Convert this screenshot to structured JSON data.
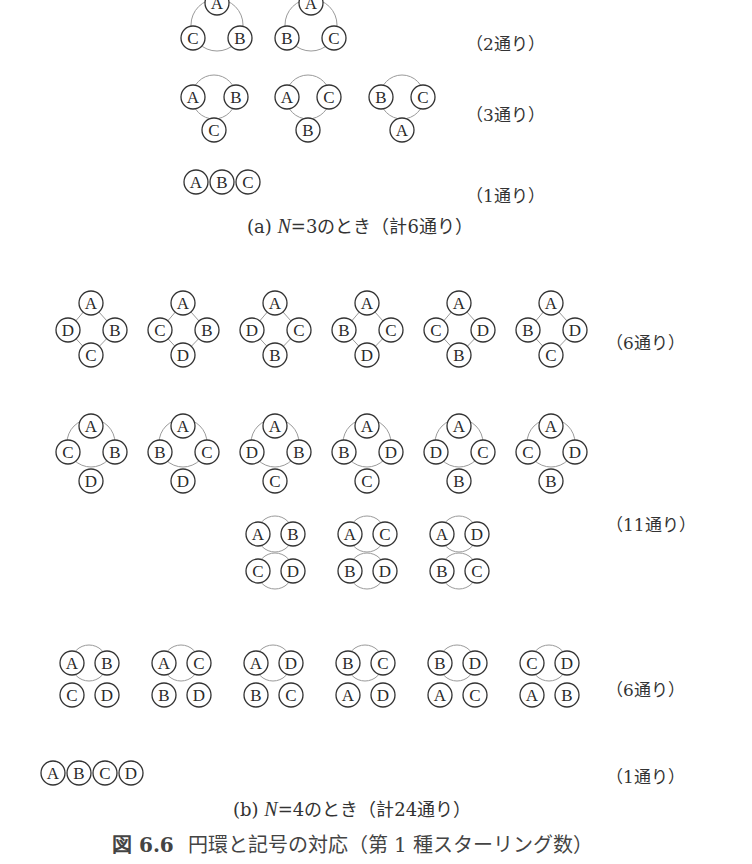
{
  "colors": {
    "node_stroke": "#333333",
    "ring_stroke": "#9a9a9a",
    "text": "#333333",
    "background": "#ffffff"
  },
  "node_radius": 12,
  "section_a": {
    "caption_prefix": "(a)",
    "caption_var": "N",
    "caption_rest": "=3のとき（計6通り）",
    "groups": [
      {
        "count_label": "（2通り）",
        "label_pos": [
          466,
          42
        ],
        "diagrams": [
          {
            "ring": [
              217,
              25,
              26
            ],
            "nodes": [
              [
                "A",
                217,
                3
              ],
              [
                "C",
                193,
                38
              ],
              [
                "B",
                240,
                38
              ]
            ]
          },
          {
            "ring": [
              311,
              25,
              26
            ],
            "nodes": [
              [
                "A",
                311,
                3
              ],
              [
                "B",
                287,
                38
              ],
              [
                "C",
                334,
                38
              ]
            ]
          }
        ]
      },
      {
        "count_label": "（3通り）",
        "label_pos": [
          466,
          113
        ],
        "diagrams": [
          {
            "ring": [
              214,
              97,
              22
            ],
            "nodes": [
              [
                "A",
                193,
                97
              ],
              [
                "B",
                236,
                97
              ],
              [
                "C",
                214,
                130
              ]
            ]
          },
          {
            "ring": [
              308,
              97,
              22
            ],
            "nodes": [
              [
                "A",
                287,
                97
              ],
              [
                "C",
                329,
                97
              ],
              [
                "B",
                308,
                130
              ]
            ]
          },
          {
            "ring": [
              402,
              97,
              22
            ],
            "nodes": [
              [
                "B",
                381,
                97
              ],
              [
                "C",
                423,
                97
              ],
              [
                "A",
                402,
                130
              ]
            ]
          }
        ]
      },
      {
        "count_label": "（1通り）",
        "label_pos": [
          466,
          194
        ],
        "diagrams": [
          {
            "ring": null,
            "nodes": [
              [
                "A",
                196,
                182
              ],
              [
                "B",
                222,
                182
              ],
              [
                "C",
                248,
                182
              ]
            ]
          }
        ]
      }
    ]
  },
  "section_b": {
    "caption_prefix": "(b)",
    "caption_var": "N",
    "caption_rest": "=4のとき（計24通り）",
    "groups": [
      {
        "count_label": "（6通り）",
        "label_pos": [
          606,
          341
        ],
        "diagrams": [
          {
            "diamond": true,
            "nodes": [
              [
                "A",
                91,
                303
              ],
              [
                "D",
                68,
                330
              ],
              [
                "B",
                115,
                330
              ],
              [
                "C",
                91,
                355
              ]
            ]
          },
          {
            "diamond": true,
            "nodes": [
              [
                "A",
                183,
                303
              ],
              [
                "C",
                160,
                330
              ],
              [
                "B",
                207,
                330
              ],
              [
                "D",
                183,
                355
              ]
            ]
          },
          {
            "diamond": true,
            "nodes": [
              [
                "A",
                275,
                303
              ],
              [
                "D",
                252,
                330
              ],
              [
                "C",
                299,
                330
              ],
              [
                "B",
                275,
                355
              ]
            ]
          },
          {
            "diamond": true,
            "nodes": [
              [
                "A",
                367,
                303
              ],
              [
                "B",
                344,
                330
              ],
              [
                "C",
                391,
                330
              ],
              [
                "D",
                367,
                355
              ]
            ]
          },
          {
            "diamond": true,
            "nodes": [
              [
                "A",
                459,
                303
              ],
              [
                "C",
                436,
                330
              ],
              [
                "D",
                483,
                330
              ],
              [
                "B",
                459,
                355
              ]
            ]
          },
          {
            "diamond": true,
            "nodes": [
              [
                "A",
                551,
                303
              ],
              [
                "B",
                528,
                330
              ],
              [
                "D",
                575,
                330
              ],
              [
                "C",
                551,
                355
              ]
            ]
          }
        ]
      },
      {
        "count_label": "（11通り）",
        "label_pos": [
          606,
          523
        ],
        "diagrams": [
          {
            "ring": [
              91,
              443,
              24
            ],
            "nodes": [
              [
                "A",
                91,
                426
              ],
              [
                "C",
                68,
                452
              ],
              [
                "B",
                115,
                452
              ],
              [
                "D",
                91,
                481
              ]
            ]
          },
          {
            "ring": [
              183,
              443,
              24
            ],
            "nodes": [
              [
                "A",
                183,
                426
              ],
              [
                "B",
                160,
                452
              ],
              [
                "C",
                207,
                452
              ],
              [
                "D",
                183,
                481
              ]
            ]
          },
          {
            "ring": [
              275,
              443,
              24
            ],
            "nodes": [
              [
                "A",
                275,
                426
              ],
              [
                "D",
                252,
                452
              ],
              [
                "B",
                299,
                452
              ],
              [
                "C",
                275,
                481
              ]
            ]
          },
          {
            "ring": [
              367,
              443,
              24
            ],
            "nodes": [
              [
                "A",
                367,
                426
              ],
              [
                "B",
                344,
                452
              ],
              [
                "D",
                391,
                452
              ],
              [
                "C",
                367,
                481
              ]
            ]
          },
          {
            "ring": [
              459,
              443,
              24
            ],
            "nodes": [
              [
                "A",
                459,
                426
              ],
              [
                "D",
                436,
                452
              ],
              [
                "C",
                483,
                452
              ],
              [
                "B",
                459,
                481
              ]
            ]
          },
          {
            "ring": [
              551,
              443,
              24
            ],
            "nodes": [
              [
                "A",
                551,
                426
              ],
              [
                "C",
                528,
                452
              ],
              [
                "D",
                575,
                452
              ],
              [
                "B",
                551,
                481
              ]
            ]
          },
          {
            "rings": [
              [
                275,
                534,
                18
              ],
              [
                275,
                571,
                18
              ]
            ],
            "nodes": [
              [
                "A",
                258,
                534
              ],
              [
                "B",
                293,
                534
              ],
              [
                "C",
                258,
                571
              ],
              [
                "D",
                293,
                571
              ]
            ]
          },
          {
            "rings": [
              [
                367,
                534,
                18
              ],
              [
                367,
                571,
                18
              ]
            ],
            "nodes": [
              [
                "A",
                350,
                534
              ],
              [
                "C",
                385,
                534
              ],
              [
                "B",
                350,
                571
              ],
              [
                "D",
                385,
                571
              ]
            ]
          },
          {
            "rings": [
              [
                459,
                534,
                18
              ],
              [
                459,
                571,
                18
              ]
            ],
            "nodes": [
              [
                "A",
                442,
                534
              ],
              [
                "D",
                477,
                534
              ],
              [
                "B",
                442,
                571
              ],
              [
                "C",
                477,
                571
              ]
            ]
          }
        ]
      },
      {
        "count_label": "（6通り）",
        "label_pos": [
          606,
          688
        ],
        "diagrams": [
          {
            "rings": [
              [
                89,
                663,
                18
              ]
            ],
            "nodes": [
              [
                "A",
                72,
                663
              ],
              [
                "B",
                107,
                663
              ],
              [
                "C",
                72,
                695
              ],
              [
                "D",
                107,
                695
              ]
            ]
          },
          {
            "rings": [
              [
                181,
                663,
                18
              ]
            ],
            "nodes": [
              [
                "A",
                164,
                663
              ],
              [
                "C",
                199,
                663
              ],
              [
                "B",
                164,
                695
              ],
              [
                "D",
                199,
                695
              ]
            ]
          },
          {
            "rings": [
              [
                273,
                663,
                18
              ]
            ],
            "nodes": [
              [
                "A",
                256,
                663
              ],
              [
                "D",
                291,
                663
              ],
              [
                "B",
                256,
                695
              ],
              [
                "C",
                291,
                695
              ]
            ]
          },
          {
            "rings": [
              [
                365,
                663,
                18
              ]
            ],
            "nodes": [
              [
                "B",
                348,
                663
              ],
              [
                "C",
                383,
                663
              ],
              [
                "A",
                348,
                695
              ],
              [
                "D",
                383,
                695
              ]
            ]
          },
          {
            "rings": [
              [
                457,
                663,
                18
              ]
            ],
            "nodes": [
              [
                "B",
                440,
                663
              ],
              [
                "D",
                475,
                663
              ],
              [
                "A",
                440,
                695
              ],
              [
                "C",
                475,
                695
              ]
            ]
          },
          {
            "rings": [
              [
                549,
                663,
                18
              ]
            ],
            "nodes": [
              [
                "C",
                532,
                663
              ],
              [
                "D",
                567,
                663
              ],
              [
                "A",
                532,
                695
              ],
              [
                "B",
                567,
                695
              ]
            ]
          }
        ]
      },
      {
        "count_label": "（1通り）",
        "label_pos": [
          606,
          775
        ],
        "diagrams": [
          {
            "ring": null,
            "nodes": [
              [
                "A",
                53,
                773
              ],
              [
                "B",
                79,
                773
              ],
              [
                "C",
                105,
                773
              ],
              [
                "D",
                131,
                773
              ]
            ]
          }
        ]
      }
    ]
  },
  "figure_caption": {
    "number": "図 6.6",
    "text": "円環と記号の対応（第 1 種スターリング数）"
  }
}
